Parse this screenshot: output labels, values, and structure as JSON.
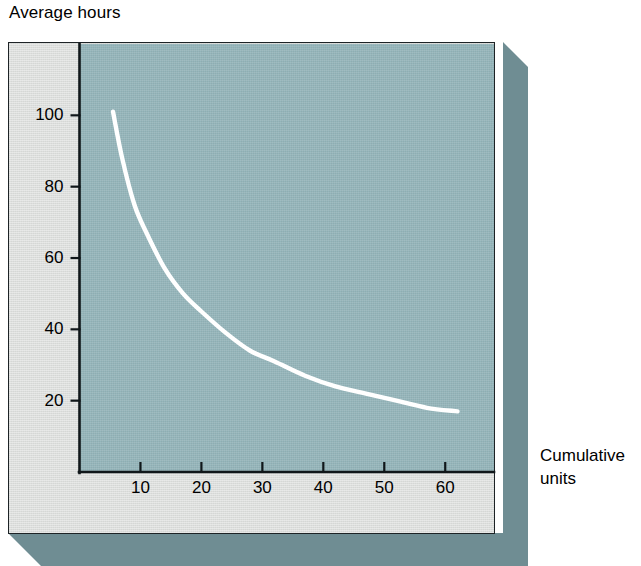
{
  "chart_data": {
    "type": "line",
    "title": "",
    "xlabel": "Cumulative units",
    "ylabel": "Average hours",
    "xlim": [
      0,
      68
    ],
    "ylim": [
      0,
      120
    ],
    "grid": false,
    "legend": null,
    "x_ticks": [
      10,
      20,
      30,
      40,
      50,
      60
    ],
    "x_tick_labels": [
      "10",
      "20",
      "30",
      "40",
      "50",
      "60"
    ],
    "y_ticks": [
      20,
      40,
      60,
      80,
      100
    ],
    "y_tick_labels": [
      "20",
      "40",
      "60",
      "80",
      "100"
    ],
    "series": [
      {
        "name": "Learning curve",
        "color": "#ffffff",
        "x": [
          5.5,
          7,
          9,
          11,
          14,
          17,
          20,
          24,
          28,
          32,
          37,
          42,
          47,
          52,
          57,
          62
        ],
        "y": [
          101,
          88,
          75,
          67,
          57,
          50,
          45,
          39,
          34,
          31,
          27,
          24,
          22,
          20,
          18,
          17
        ]
      }
    ],
    "annotations": []
  },
  "labels": {
    "y_axis_caption": "Average hours",
    "x_axis_caption_line1": "Cumulative",
    "x_axis_caption_line2": "units"
  },
  "colors": {
    "plot_background": "#94b5ba",
    "panel_background": "#dcdedc",
    "shadow": "#6f8d93",
    "axis": "#10171a",
    "curve": "#ffffff",
    "page_background": "#ffffff"
  }
}
